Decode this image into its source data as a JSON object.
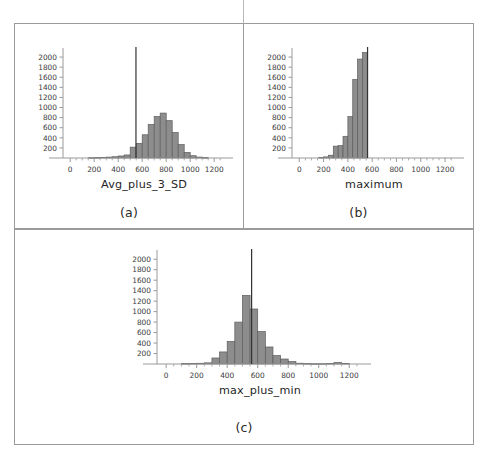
{
  "figure": {
    "caption_a": "(a)",
    "caption_b": "(b)",
    "caption_c": "(c)"
  },
  "chart_data": [
    {
      "id": "a",
      "type": "bar",
      "title": "",
      "xlabel": "Avg_plus_3_SD",
      "ylabel": "",
      "xlim": [
        -60,
        1290
      ],
      "ylim": [
        0,
        2100
      ],
      "grid": false,
      "legend": "none",
      "xticks": [
        0,
        200,
        400,
        600,
        800,
        1000,
        1200
      ],
      "xticklabels": [
        "0",
        "200",
        "400",
        "600",
        "800",
        "1000",
        "1200"
      ],
      "yticks": [
        200,
        400,
        600,
        800,
        1000,
        1200,
        1400,
        1600,
        1800,
        2000
      ],
      "yticklabels": [
        "200",
        "400",
        "600",
        "800",
        "1000",
        "1200",
        "1400",
        "1600",
        "1800",
        "2000"
      ],
      "bin_width": 50,
      "bin_starts": [
        150,
        200,
        250,
        300,
        350,
        400,
        450,
        500,
        550,
        600,
        650,
        700,
        750,
        800,
        850,
        900,
        950,
        1000,
        1050,
        1100
      ],
      "values": [
        5,
        8,
        12,
        18,
        25,
        40,
        60,
        215,
        290,
        460,
        665,
        820,
        890,
        740,
        505,
        265,
        110,
        45,
        18,
        8
      ],
      "reference_line": {
        "x": 548,
        "label": ""
      },
      "bar_color": "#8d8d8d",
      "bar_edge_color": "#5d5d5d",
      "refline_color": "#333333"
    },
    {
      "id": "b",
      "type": "bar",
      "title": "",
      "xlabel": "maximum",
      "ylabel": "",
      "xlim": [
        -60,
        1290
      ],
      "ylim": [
        0,
        2100
      ],
      "grid": false,
      "legend": "none",
      "xticks": [
        0,
        200,
        400,
        600,
        800,
        1000,
        1200
      ],
      "xticklabels": [
        "0",
        "200",
        "400",
        "600",
        "800",
        "1000",
        "1200"
      ],
      "yticks": [
        200,
        400,
        600,
        800,
        1000,
        1200,
        1400,
        1600,
        1800,
        2000
      ],
      "yticklabels": [
        "200",
        "400",
        "600",
        "800",
        "1000",
        "1200",
        "1400",
        "1600",
        "1800",
        "2000"
      ],
      "bin_width": 40,
      "bin_starts": [
        160,
        200,
        240,
        280,
        320,
        360,
        400,
        440,
        480,
        520
      ],
      "values": [
        10,
        22,
        55,
        235,
        245,
        430,
        820,
        1555,
        1960,
        2090
      ],
      "reference_line": {
        "x": 562,
        "label": ""
      },
      "bar_color": "#8d8d8d",
      "bar_edge_color": "#5d5d5d",
      "refline_color": "#333333"
    },
    {
      "id": "c",
      "type": "bar",
      "title": "",
      "xlabel": "max_plus_min",
      "ylabel": "",
      "xlim": [
        -60,
        1290
      ],
      "ylim": [
        0,
        2100
      ],
      "grid": false,
      "legend": "none",
      "xticks": [
        0,
        200,
        400,
        600,
        800,
        1000,
        1200
      ],
      "xticklabels": [
        "0",
        "200",
        "400",
        "600",
        "800",
        "1000",
        "1200"
      ],
      "yticks": [
        200,
        400,
        600,
        800,
        1000,
        1200,
        1400,
        1600,
        1800,
        2000
      ],
      "yticklabels": [
        "200",
        "400",
        "600",
        "800",
        "1000",
        "1200",
        "1400",
        "1600",
        "1800",
        "2000"
      ],
      "bin_width": 50,
      "bin_starts": [
        100,
        150,
        200,
        250,
        300,
        350,
        400,
        450,
        500,
        550,
        600,
        650,
        700,
        750,
        800,
        850,
        900,
        950,
        1000,
        1050,
        1100,
        1150
      ],
      "values": [
        8,
        10,
        14,
        22,
        115,
        230,
        430,
        800,
        1310,
        1050,
        620,
        325,
        160,
        95,
        45,
        15,
        8,
        6,
        6,
        10,
        28,
        10
      ],
      "reference_line": {
        "x": 560,
        "label": ""
      },
      "bar_color": "#8d8d8d",
      "bar_edge_color": "#5d5d5d",
      "refline_color": "#333333"
    }
  ]
}
